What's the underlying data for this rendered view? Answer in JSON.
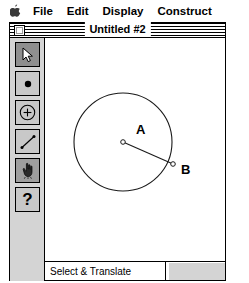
{
  "menubar": {
    "apple_icon": "apple-icon",
    "items": [
      {
        "label": "File"
      },
      {
        "label": "Edit"
      },
      {
        "label": "Display"
      },
      {
        "label": "Construct"
      }
    ]
  },
  "window": {
    "title": "Untitled #2",
    "close_box": "close-box"
  },
  "toolbar": {
    "tools": [
      {
        "name": "selection-arrow-tool",
        "icon": "arrow-icon",
        "selected": true
      },
      {
        "name": "point-tool",
        "icon": "point-icon",
        "selected": false
      },
      {
        "name": "circle-tool",
        "icon": "circle-icon",
        "selected": false
      },
      {
        "name": "segment-tool",
        "icon": "segment-icon",
        "selected": false
      },
      {
        "name": "text-hand-tool",
        "icon": "hand-icon",
        "selected": true
      },
      {
        "name": "help-tool",
        "icon": "question-icon",
        "selected": false
      }
    ]
  },
  "canvas": {
    "circle": {
      "cx": 78,
      "cy": 104,
      "r": 49
    },
    "points": [
      {
        "id": "A",
        "label": "A",
        "x": 78,
        "y": 104,
        "label_x": 91,
        "label_y": 96
      },
      {
        "id": "B",
        "label": "B",
        "x": 128,
        "y": 126,
        "label_x": 136,
        "label_y": 136
      }
    ],
    "segment": {
      "x1": 78,
      "y1": 104,
      "x2": 128,
      "y2": 126
    }
  },
  "statusbar": {
    "mode_text": "Select & Translate"
  },
  "colors": {
    "window_bg": "#ffffff",
    "toolbar_bg": "#d4d4d4",
    "tool_face": "#c8c8c8",
    "tool_selected": "#8f8f8f",
    "ink": "#000000"
  }
}
